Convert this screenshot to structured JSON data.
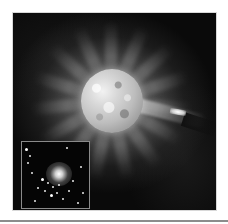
{
  "image": {
    "subject": "artist illustration of an exploding star with a radial nebula and a jet toward a companion object",
    "colorscheme": "grayscale",
    "inset": {
      "description": "photograph of a bright object within a star cluster",
      "border_color": "#8a8a8a"
    }
  },
  "colors": {
    "page_background": "#ffffff",
    "photo_background": "#0a0a0a",
    "rule": "#8c8c8c"
  }
}
